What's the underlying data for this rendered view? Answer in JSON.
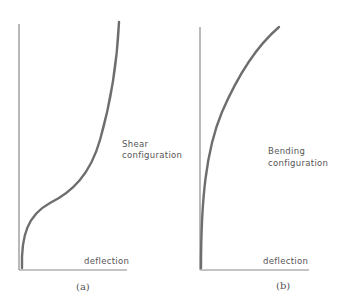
{
  "figure": {
    "panels": [
      {
        "id": "a",
        "caption": "(a)",
        "x_axis_label": "deflection",
        "annotation_line1": "Shear",
        "annotation_line2": "configuration",
        "curve_shape": "S-shaped (shear profile): vertical at base, bulges out near lower third, then steepens toward top"
      },
      {
        "id": "b",
        "caption": "(b)",
        "x_axis_label": "deflection",
        "annotation_line1": "Bending",
        "annotation_line2": "configuration",
        "curve_shape": "concave (bending profile): vertical at base, curving increasingly outward toward top"
      }
    ],
    "colors": {
      "curve": "#6e6e6e",
      "axis": "#8a8a8a",
      "text": "#555555"
    }
  }
}
